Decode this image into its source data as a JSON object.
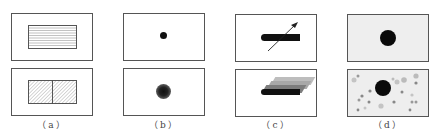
{
  "figure": {
    "panels": [
      {
        "id": "a",
        "label": "（a）",
        "top": "horizontal-striped-rectangle",
        "bottom": "two-hatched-rectangles"
      },
      {
        "id": "b",
        "label": "（b）",
        "top": "small-black-dot",
        "bottom": "blurred-dot"
      },
      {
        "id": "c",
        "label": "（c）",
        "top": "bar-with-arrow",
        "bottom": "stacked-motion-bars"
      },
      {
        "id": "d",
        "label": "（d）",
        "top": "large-black-dot-on-grey",
        "bottom": "large-dot-with-noise-speckles"
      }
    ]
  },
  "labels": {
    "a": "（a）",
    "b": "（b）",
    "c": "（c）",
    "d": "（d）"
  }
}
